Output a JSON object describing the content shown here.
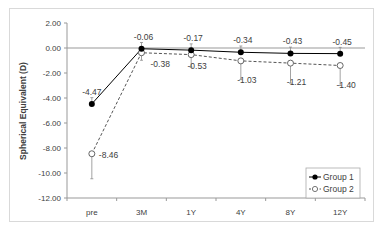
{
  "chart_data": {
    "type": "line",
    "title": "",
    "xlabel": "",
    "ylabel": "Spherical Equivalent (D)",
    "categories": [
      "pre",
      "3M",
      "1Y",
      "4Y",
      "8Y",
      "12Y"
    ],
    "ylim": [
      -12,
      2
    ],
    "yticks": [
      2,
      0,
      -2,
      -4,
      -6,
      -8,
      -10,
      -12
    ],
    "ytick_labels": [
      "2.00",
      "0.00",
      "-2.00",
      "-4.00",
      "-6.00",
      "-8.00",
      "-10.00",
      "-12.00"
    ],
    "grid": false,
    "legend_position": "lower right",
    "series": [
      {
        "name": "Group 1",
        "values": [
          -4.47,
          -0.06,
          -0.17,
          -0.34,
          -0.43,
          -0.45
        ],
        "labels": [
          "-4.47",
          "-0.06",
          "-0.17",
          "-0.34",
          "-0.43",
          "-0.45"
        ],
        "marker": "filled-circle",
        "line": "solid",
        "error_up": [
          0.5,
          0.5,
          0.5,
          0.5,
          0.5,
          0.5
        ]
      },
      {
        "name": "Group 2",
        "values": [
          -8.46,
          -0.38,
          -0.53,
          -1.03,
          -1.21,
          -1.4
        ],
        "labels": [
          "-8.46",
          "-0.38",
          "-0.53",
          "-1.03",
          "-1.21",
          "-1.40"
        ],
        "marker": "open-circle",
        "line": "dashed",
        "error_down": [
          2.0,
          0.6,
          1.0,
          1.5,
          1.6,
          1.6
        ]
      }
    ]
  },
  "colors": {
    "series1": "#000000",
    "series2": "#555555",
    "axis": "#999999",
    "error": "#8c8c8c",
    "border": "#d9d9d9",
    "text": "#404040"
  }
}
